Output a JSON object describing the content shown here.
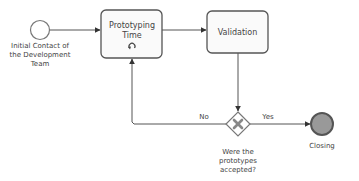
{
  "diagram": {
    "type": "BPMN process",
    "start_event": {
      "label_lines": [
        "Initial Contact of",
        "the Development",
        "Team"
      ]
    },
    "tasks": [
      {
        "id": "prototyping",
        "label_lines": [
          "Prototyping",
          "Time"
        ],
        "marker": "loop-icon"
      },
      {
        "id": "validation",
        "label_lines": [
          "Validation"
        ]
      }
    ],
    "gateway": {
      "type": "exclusive",
      "marker": "x-icon",
      "label_lines": [
        "Were the",
        "prototypes",
        "accepted?"
      ]
    },
    "flows": {
      "no_label": "No",
      "yes_label": "Yes"
    },
    "end_event": {
      "label": "Closing"
    },
    "colors": {
      "stroke": "#555555",
      "task_fill": "#fafafa",
      "end_fill": "#999999",
      "gateway_marker": "#888888",
      "text": "#444444"
    }
  }
}
